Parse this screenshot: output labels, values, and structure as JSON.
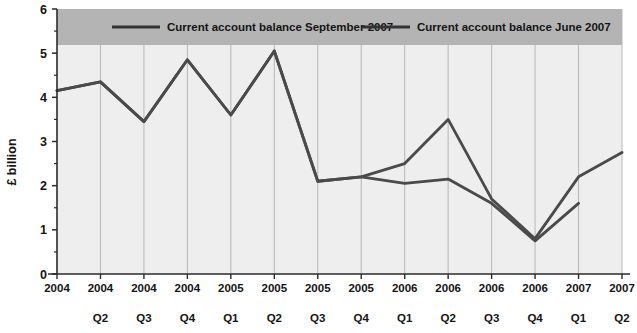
{
  "chart_data": {
    "type": "line",
    "title": "",
    "xlabel": "",
    "ylabel": "£ billion",
    "ylim": [
      0,
      6
    ],
    "yticks": [
      0,
      1,
      2,
      3,
      4,
      5,
      6
    ],
    "ytick_labels": [
      "0",
      "1",
      "2",
      "3",
      "4",
      "5",
      "6"
    ],
    "grid": "vertical",
    "legend_position": "top",
    "categories": [
      {
        "year": "2004",
        "quarter": ""
      },
      {
        "year": "2004",
        "quarter": "Q2"
      },
      {
        "year": "2004",
        "quarter": "Q3"
      },
      {
        "year": "2004",
        "quarter": "Q4"
      },
      {
        "year": "2005",
        "quarter": "Q1"
      },
      {
        "year": "2005",
        "quarter": "Q2"
      },
      {
        "year": "2005",
        "quarter": "Q3"
      },
      {
        "year": "2005",
        "quarter": "Q4"
      },
      {
        "year": "2006",
        "quarter": "Q1"
      },
      {
        "year": "2006",
        "quarter": "Q2"
      },
      {
        "year": "2006",
        "quarter": "Q3"
      },
      {
        "year": "2006",
        "quarter": "Q4"
      },
      {
        "year": "2007",
        "quarter": "Q1"
      },
      {
        "year": "2007",
        "quarter": "Q2"
      }
    ],
    "series": [
      {
        "name": "Current account balance September 2007",
        "color": "#4a4a4a",
        "values": [
          4.15,
          4.35,
          3.45,
          4.85,
          3.6,
          5.05,
          2.1,
          2.2,
          2.5,
          3.5,
          1.7,
          0.8,
          2.2,
          2.75
        ]
      },
      {
        "name": "Current account balance June 2007",
        "color": "#4a4a4a",
        "values": [
          4.15,
          4.35,
          3.45,
          4.85,
          3.6,
          5.05,
          2.1,
          2.2,
          2.05,
          2.15,
          1.6,
          0.75,
          1.6,
          null
        ]
      }
    ]
  },
  "legend": {
    "entries": [
      {
        "label": "Current account balance September 2007"
      },
      {
        "label": "Current account balance June 2007"
      }
    ],
    "band_color": "#b4b4b4"
  },
  "axes": {
    "y_axis_title": "£ billion",
    "y_tick_0": "0",
    "y_tick_1": "1",
    "y_tick_2": "2",
    "y_tick_3": "3",
    "y_tick_4": "4",
    "y_tick_5": "5",
    "y_tick_6": "6"
  },
  "colors": {
    "plot_background": "#eeeeee",
    "gridline": "#b0b0b0",
    "axis": "#2b2b2b",
    "series_line": "#4a4a4a",
    "legend_band": "#b4b4b4"
  }
}
